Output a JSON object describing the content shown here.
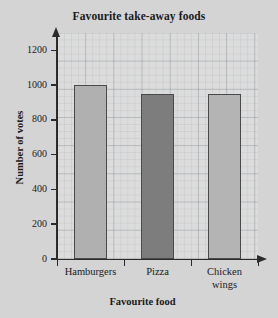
{
  "chart_data": {
    "type": "bar",
    "title": "Favourite take-away foods",
    "xlabel": "Favourite food",
    "ylabel": "Number of votes",
    "categories": [
      "Hamburgers",
      "Pizza",
      "Chicken wings"
    ],
    "category_lines": [
      [
        "Hamburgers"
      ],
      [
        "Pizza"
      ],
      [
        "Chicken",
        "wings"
      ]
    ],
    "values": [
      1000,
      950,
      950
    ],
    "ylim": [
      0,
      1300
    ],
    "yticks": [
      0,
      200,
      400,
      600,
      800,
      1000,
      1200
    ],
    "ytick_labels": [
      "0",
      "200",
      "400",
      "600",
      "800",
      "1000",
      "1200"
    ],
    "grid": true,
    "legend": false,
    "bar_colors": [
      "#b0b0b0",
      "#7d7d7d",
      "#b4b4b4"
    ],
    "bar_border_color": "#4a4a4a",
    "background_color": "#d4d4d4",
    "plot_background_color": "#dcdcdc",
    "axis_color": "#2b2b2b"
  }
}
